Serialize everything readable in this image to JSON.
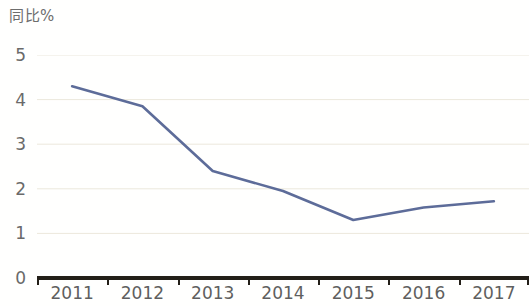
{
  "chart_data": {
    "type": "line",
    "title": "同比%",
    "xlabel": "",
    "ylabel": "",
    "categories": [
      "2011",
      "2012",
      "2013",
      "2014",
      "2015",
      "2016",
      "2017"
    ],
    "series": [
      {
        "name": "同比%",
        "color": "#5d6c99",
        "values": [
          4.3,
          3.85,
          2.4,
          1.95,
          1.3,
          1.58,
          1.72
        ]
      }
    ],
    "ylim": [
      0,
      5
    ],
    "ytick_labels": [
      "0",
      "1",
      "2",
      "3",
      "4",
      "5"
    ],
    "ytick_values": [
      0,
      1,
      2,
      3,
      4,
      5
    ],
    "grid": true,
    "grid_axis": "y",
    "grid_color": "#ece8dc",
    "legend": false,
    "legend_position": "none",
    "markers": false,
    "axis_color": "#231f18",
    "label_color": "#6a6a6a",
    "title_color": "#6d6d6d",
    "background": "#ffffff"
  }
}
